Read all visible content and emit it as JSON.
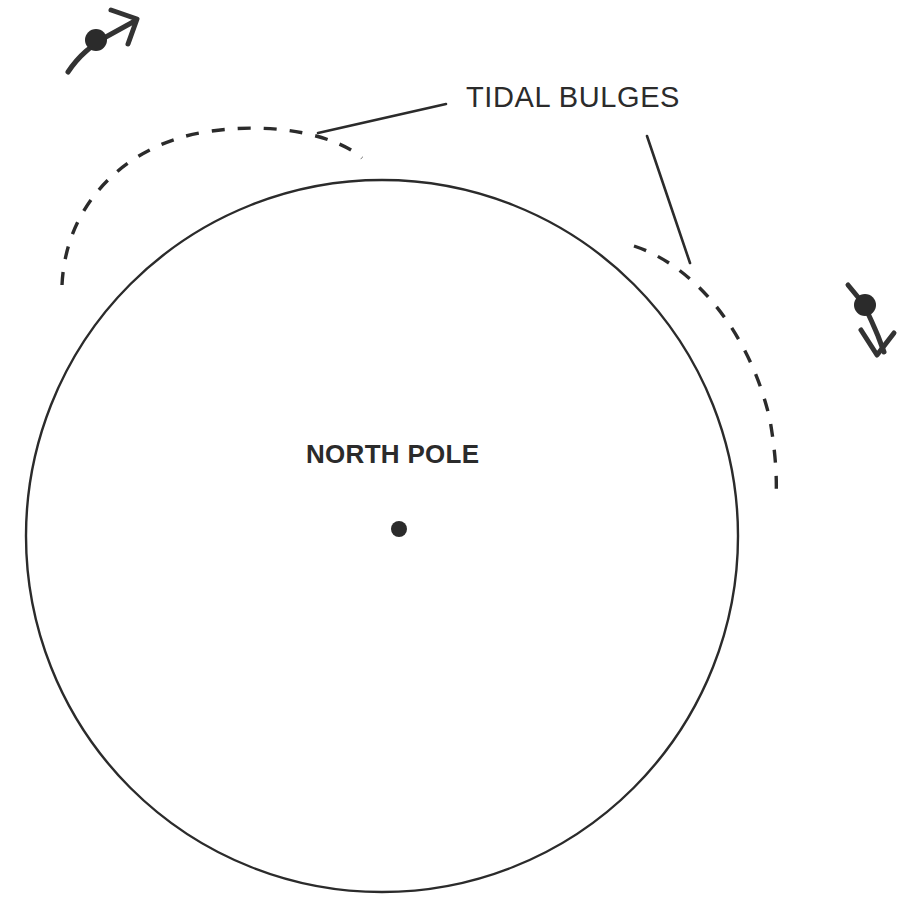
{
  "diagram": {
    "title_label": "TIDAL BULGES",
    "center_label": "NORTH POLE",
    "colors": {
      "ink": "#2b2b2b",
      "background": "#ffffff",
      "moon_stroke": "#333333"
    },
    "earth": {
      "name": "earth-circle",
      "center_x": 382,
      "center_y": 536,
      "radius": 356,
      "style": "solid"
    },
    "center_point": {
      "name": "north-pole-point",
      "x": 399,
      "y": 529,
      "radius": 8
    },
    "bulges": [
      {
        "name": "tidal-bulge-upper-left",
        "style": "dashed",
        "path": "M 62 285 C 66 200 130 144 205 132 C 280 120 340 138 362 158"
      },
      {
        "name": "tidal-bulge-right",
        "style": "dashed",
        "path": "M 634 246 C 700 268 752 340 770 420 C 776 455 777 480 776 500"
      }
    ],
    "leaders": [
      {
        "name": "leader-line-left",
        "path": "M 318 133 L 446 104"
      },
      {
        "name": "leader-line-right",
        "path": "M 647 136 L 690 263"
      }
    ],
    "moons": [
      {
        "name": "moon-marker-top-left",
        "dot_x": 96,
        "dot_y": 40,
        "dot_radius": 11,
        "track_path": "M 68 72 C 80 54 92 46 104 38 L 133 22",
        "arrow_path": "M 111 10 L 137 19 L 128 44",
        "direction": "up-right"
      },
      {
        "name": "moon-marker-right",
        "dot_x": 865,
        "dot_y": 305,
        "dot_radius": 11,
        "track_path": "M 848 285 L 862 302 C 868 312 872 322 878 336 L 884 352",
        "arrow_path": "M 861 330 L 877 355 L 894 333",
        "direction": "down-right"
      }
    ],
    "text_positions": {
      "tidal_x": 466,
      "tidal_y": 107,
      "pole_x": 306,
      "pole_y": 463
    }
  }
}
